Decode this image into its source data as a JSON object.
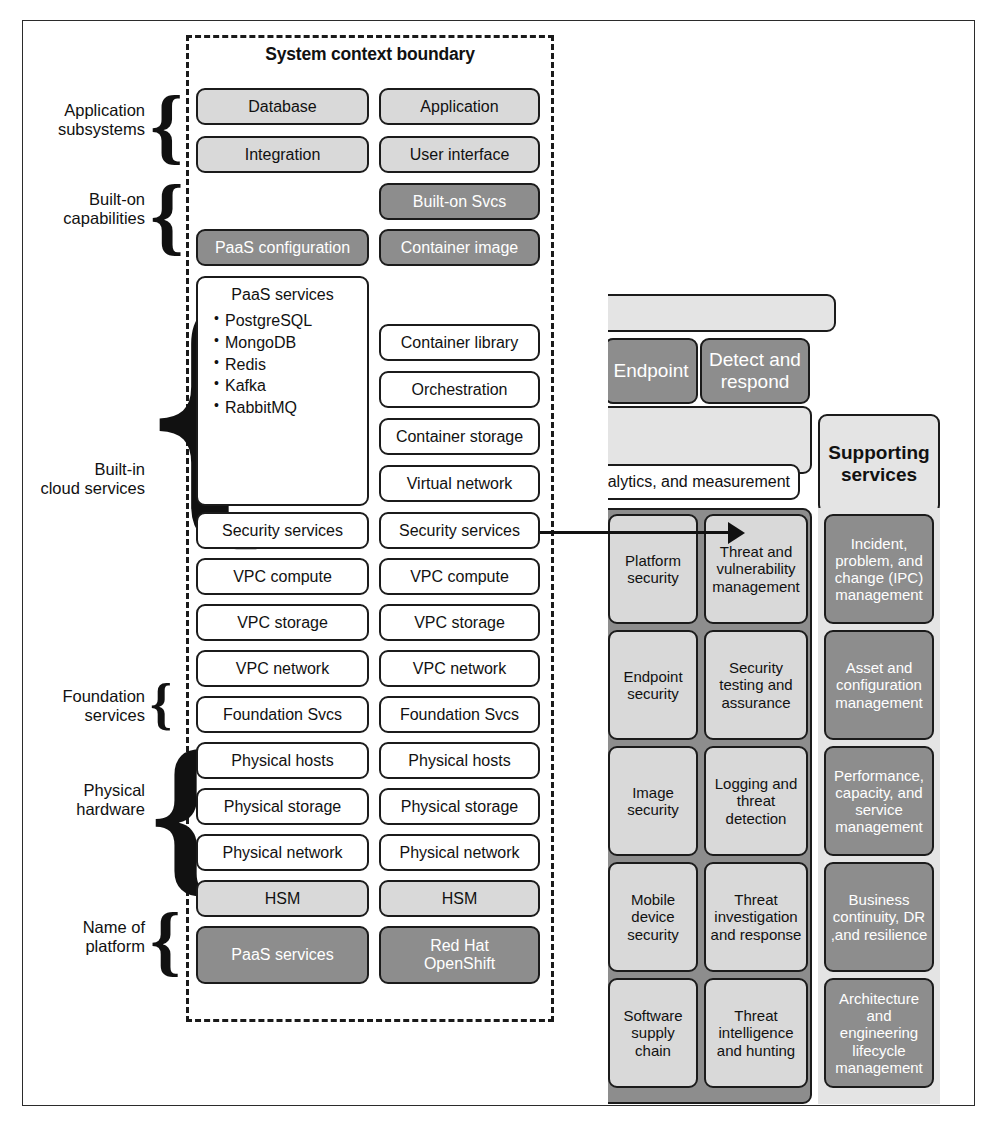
{
  "diagram": {
    "colors": {
      "light_gray": "#d9d9d9",
      "dark_gray": "#8d8d8d",
      "white": "#ffffff",
      "outline": "#1b1b1b"
    }
  },
  "system_context": {
    "boundary_label": "System context boundary",
    "bracket_labels": [
      {
        "line1": "Application",
        "line2": "subsystems"
      },
      {
        "line1": "Built-on",
        "line2": "capabilities"
      },
      {
        "line1": "Built-in",
        "line2": "cloud services"
      },
      {
        "line1": "Foundation",
        "line2": "services"
      },
      {
        "line1": "Physical",
        "line2": "hardware"
      },
      {
        "line1": "Name of",
        "line2": "platform"
      }
    ],
    "left_column": {
      "database": "Database",
      "integration": "Integration",
      "paas_configuration": "PaaS configuration",
      "paas_services_title": "PaaS services",
      "paas_services_items": [
        "PostgreSQL",
        "MongoDB",
        "Redis",
        "Kafka",
        "RabbitMQ"
      ],
      "security_services": "Security services",
      "vpc_compute": "VPC compute",
      "vpc_storage": "VPC storage",
      "vpc_network": "VPC network",
      "foundation_svcs": "Foundation Svcs",
      "physical_hosts": "Physical hosts",
      "physical_storage": "Physical storage",
      "physical_network": "Physical network",
      "hsm": "HSM",
      "platform_name": "PaaS services"
    },
    "right_column": {
      "application": "Application",
      "user_interface": "User interface",
      "built_on_svcs": "Built-on Svcs",
      "container_image": "Container image",
      "container_library": "Container library",
      "orchestration": "Orchestration",
      "container_storage": "Container storage",
      "virtual_network": "Virtual network",
      "security_services": "Security services",
      "vpc_compute": "VPC compute",
      "vpc_storage": "VPC storage",
      "vpc_network": "VPC network",
      "foundation_svcs": "Foundation Svcs",
      "physical_hosts": "Physical hosts",
      "physical_storage": "Physical storage",
      "physical_network": "Physical network",
      "hsm": "HSM",
      "platform_name_line1": "Red Hat",
      "platform_name_line2": "OpenShift"
    }
  },
  "security_panel": {
    "headers": {
      "endpoint": "Endpoint",
      "detect_and_respond": "Detect and\nrespond",
      "supporting_services": "Supporting\nservices",
      "analytics_band": "nalytics, and measurement"
    },
    "column_endpoint": [
      "Platform security",
      "Endpoint security",
      "Image security",
      "Mobile device security",
      "Software supply chain"
    ],
    "column_detect_respond": [
      "Threat and vulnerability management",
      "Security testing and assurance",
      "Logging and threat detection",
      "Threat investigation and response",
      "Threat intelligence and hunting"
    ],
    "column_supporting": [
      "Incident, problem, and change (IPC) management",
      "Asset and configuration management",
      "Performance, capacity, and service management",
      "Business continuity, DR ,and resilience",
      "Architecture and engineering lifecycle management"
    ]
  }
}
